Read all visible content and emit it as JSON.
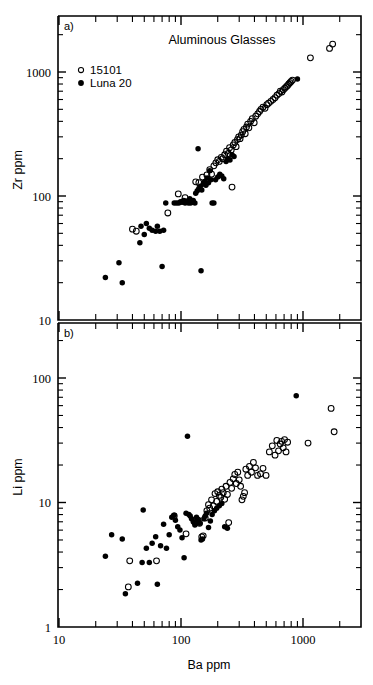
{
  "figure": {
    "title": "Aluminous Glasses",
    "xlabel": "Ba ppm",
    "legend": [
      {
        "label": "15101",
        "marker": "open-circle"
      },
      {
        "label": "Luna 20",
        "marker": "filled-circle"
      }
    ],
    "panel_a_label": "a)",
    "panel_b_label": "b)"
  },
  "chart_data": [
    {
      "type": "scatter",
      "panel": "a)",
      "title": "Aluminous Glasses",
      "xlabel": "Ba ppm",
      "ylabel": "Zr ppm",
      "xscale": "log",
      "yscale": "log",
      "xlim": [
        10,
        2900
      ],
      "ylim": [
        10,
        2500
      ],
      "xticklabels": [
        "10",
        "100",
        "1000"
      ],
      "xtickvalues": [
        10,
        100,
        1000
      ],
      "yticklabels": [
        "10",
        "100",
        "1000"
      ],
      "ytickvalues": [
        10,
        100,
        1000
      ],
      "grid": false,
      "legend_position": "upper-left",
      "series": [
        {
          "name": "15101",
          "marker": "open-circle",
          "points": [
            [
              40,
              54
            ],
            [
              43,
              52
            ],
            [
              78,
              73
            ],
            [
              95,
              104
            ],
            [
              108,
              97
            ],
            [
              132,
              130
            ],
            [
              140,
              128
            ],
            [
              150,
              142
            ],
            [
              163,
              148
            ],
            [
              172,
              163
            ],
            [
              178,
              150
            ],
            [
              186,
              175
            ],
            [
              193,
              185
            ],
            [
              200,
              196
            ],
            [
              206,
              190
            ],
            [
              214,
              205
            ],
            [
              220,
              200
            ],
            [
              228,
              215
            ],
            [
              236,
              230
            ],
            [
              244,
              220
            ],
            [
              250,
              245
            ],
            [
              258,
              235
            ],
            [
              262,
              118
            ],
            [
              268,
              258
            ],
            [
              276,
              270
            ],
            [
              283,
              250
            ],
            [
              290,
              285
            ],
            [
              297,
              300
            ],
            [
              305,
              290
            ],
            [
              312,
              310
            ],
            [
              320,
              330
            ],
            [
              328,
              345
            ],
            [
              336,
              318
            ],
            [
              344,
              360
            ],
            [
              352,
              380
            ],
            [
              360,
              355
            ],
            [
              372,
              400
            ],
            [
              384,
              420
            ],
            [
              398,
              390
            ],
            [
              410,
              440
            ],
            [
              425,
              460
            ],
            [
              440,
              480
            ],
            [
              452,
              500
            ],
            [
              470,
              520
            ],
            [
              488,
              510
            ],
            [
              505,
              545
            ],
            [
              522,
              560
            ],
            [
              545,
              580
            ],
            [
              568,
              600
            ],
            [
              590,
              620
            ],
            [
              612,
              650
            ],
            [
              635,
              670
            ],
            [
              652,
              700
            ],
            [
              672,
              690
            ],
            [
              690,
              720
            ],
            [
              710,
              740
            ],
            [
              730,
              760
            ],
            [
              748,
              780
            ],
            [
              765,
              800
            ],
            [
              782,
              820
            ],
            [
              800,
              840
            ],
            [
              820,
              860
            ],
            [
              1150,
              1300
            ],
            [
              1650,
              1550
            ],
            [
              1750,
              1680
            ]
          ]
        },
        {
          "name": "Luna 20",
          "marker": "filled-circle",
          "points": [
            [
              24,
              22
            ],
            [
              33,
              20
            ],
            [
              31,
              29
            ],
            [
              46,
              42
            ],
            [
              47,
              57
            ],
            [
              50,
              49
            ],
            [
              52,
              60
            ],
            [
              55,
              55
            ],
            [
              58,
              53
            ],
            [
              62,
              52
            ],
            [
              64,
              57
            ],
            [
              67,
              52
            ],
            [
              70,
              27
            ],
            [
              72,
              53
            ],
            [
              75,
              88
            ],
            [
              88,
              88
            ],
            [
              92,
              88
            ],
            [
              96,
              88
            ],
            [
              99,
              90
            ],
            [
              102,
              89
            ],
            [
              105,
              92
            ],
            [
              108,
              88
            ],
            [
              110,
              91
            ],
            [
              112,
              90
            ],
            [
              115,
              88
            ],
            [
              118,
              95
            ],
            [
              120,
              88
            ],
            [
              124,
              89
            ],
            [
              126,
              92
            ],
            [
              130,
              88
            ],
            [
              132,
              105
            ],
            [
              136,
              110
            ],
            [
              138,
              240
            ],
            [
              140,
              115
            ],
            [
              144,
              120
            ],
            [
              146,
              25
            ],
            [
              148,
              112
            ],
            [
              152,
              125
            ],
            [
              156,
              130
            ],
            [
              160,
              122
            ],
            [
              164,
              140
            ],
            [
              168,
              128
            ],
            [
              172,
              160
            ],
            [
              176,
              135
            ],
            [
              180,
              88
            ],
            [
              186,
              88
            ],
            [
              192,
              135
            ],
            [
              200,
              142
            ],
            [
              208,
              150
            ],
            [
              216,
              145
            ],
            [
              224,
              138
            ],
            [
              234,
              190
            ],
            [
              244,
              200
            ],
            [
              252,
              195
            ],
            [
              262,
              215
            ],
            [
              272,
              208
            ],
            [
              900,
              880
            ]
          ]
        }
      ]
    },
    {
      "type": "scatter",
      "panel": "b)",
      "xlabel": "Ba ppm",
      "ylabel": "Li ppm",
      "xscale": "log",
      "yscale": "log",
      "xlim": [
        10,
        2900
      ],
      "ylim": [
        1,
        200
      ],
      "xticklabels": [
        "10",
        "100",
        "1000"
      ],
      "xtickvalues": [
        10,
        100,
        1000
      ],
      "yticklabels": [
        "1",
        "10",
        "100"
      ],
      "ytickvalues": [
        1,
        10,
        100
      ],
      "grid": false,
      "series": [
        {
          "name": "15101",
          "marker": "open-circle",
          "points": [
            [
              38,
              3.4
            ],
            [
              37,
              2.1
            ],
            [
              63,
              3.4
            ],
            [
              88,
              7.8
            ],
            [
              110,
              5.6
            ],
            [
              130,
              6.9
            ],
            [
              138,
              7.2
            ],
            [
              142,
              6.8
            ],
            [
              148,
              5.3
            ],
            [
              152,
              5.4
            ],
            [
              158,
              7.5
            ],
            [
              163,
              8.6
            ],
            [
              168,
              9.6
            ],
            [
              172,
              9.0
            ],
            [
              178,
              10.5
            ],
            [
              184,
              9.4
            ],
            [
              190,
              11.8
            ],
            [
              196,
              10.2
            ],
            [
              200,
              12.2
            ],
            [
              206,
              11.4
            ],
            [
              212,
              11.0
            ],
            [
              216,
              12.8
            ],
            [
              222,
              12.0
            ],
            [
              228,
              10.6
            ],
            [
              234,
              13.5
            ],
            [
              240,
              11.6
            ],
            [
              246,
              6.9
            ],
            [
              252,
              14.5
            ],
            [
              260,
              13.0
            ],
            [
              268,
              15.5
            ],
            [
              276,
              16.8
            ],
            [
              284,
              14.2
            ],
            [
              292,
              17.5
            ],
            [
              300,
              15.2
            ],
            [
              308,
              13.5
            ],
            [
              316,
              10.5
            ],
            [
              324,
              11.2
            ],
            [
              332,
              12.0
            ],
            [
              340,
              18.5
            ],
            [
              352,
              16.5
            ],
            [
              364,
              19.5
            ],
            [
              378,
              17.5
            ],
            [
              392,
              21.0
            ],
            [
              408,
              19.0
            ],
            [
              424,
              16.5
            ],
            [
              448,
              17.0
            ],
            [
              470,
              18.8
            ],
            [
              498,
              16.5
            ],
            [
              530,
              25.5
            ],
            [
              560,
              28.5
            ],
            [
              590,
              24.0
            ],
            [
              610,
              31.5
            ],
            [
              630,
              26.0
            ],
            [
              650,
              29.5
            ],
            [
              668,
              31.0
            ],
            [
              688,
              27.5
            ],
            [
              706,
              32.0
            ],
            [
              726,
              25.5
            ],
            [
              748,
              30.5
            ],
            [
              1100,
              30.0
            ],
            [
              1700,
              57.0
            ],
            [
              1800,
              37.0
            ]
          ]
        },
        {
          "name": "Luna 20",
          "marker": "filled-circle",
          "points": [
            [
              24,
              3.7
            ],
            [
              27,
              5.5
            ],
            [
              33,
              5.1
            ],
            [
              35,
              1.85
            ],
            [
              44,
              2.25
            ],
            [
              48,
              3.3
            ],
            [
              49,
              8.7
            ],
            [
              52,
              4.3
            ],
            [
              55,
              3.3
            ],
            [
              58,
              4.7
            ],
            [
              62,
              5.3
            ],
            [
              64,
              2.2
            ],
            [
              68,
              4.5
            ],
            [
              72,
              6.7
            ],
            [
              76,
              4.3
            ],
            [
              80,
              5.5
            ],
            [
              84,
              7.6
            ],
            [
              88,
              7.9
            ],
            [
              90,
              7.2
            ],
            [
              94,
              6.4
            ],
            [
              98,
              6.0
            ],
            [
              102,
              5.2
            ],
            [
              106,
              3.6
            ],
            [
              110,
              8.2
            ],
            [
              113,
              34.0
            ],
            [
              116,
              8.0
            ],
            [
              119,
              7.8
            ],
            [
              122,
              7.4
            ],
            [
              126,
              7.0
            ],
            [
              130,
              6.6
            ],
            [
              134,
              7.6
            ],
            [
              138,
              7.2
            ],
            [
              142,
              6.8
            ],
            [
              146,
              5.0
            ],
            [
              150,
              5.1
            ],
            [
              154,
              7.4
            ],
            [
              158,
              7.8
            ],
            [
              162,
              8.2
            ],
            [
              168,
              6.3
            ],
            [
              174,
              7.1
            ],
            [
              180,
              8.0
            ],
            [
              188,
              8.6
            ],
            [
              196,
              9.0
            ],
            [
              206,
              9.4
            ],
            [
              216,
              9.8
            ],
            [
              228,
              6.4
            ],
            [
              240,
              6.2
            ],
            [
              880,
              72.0
            ]
          ]
        }
      ]
    }
  ]
}
